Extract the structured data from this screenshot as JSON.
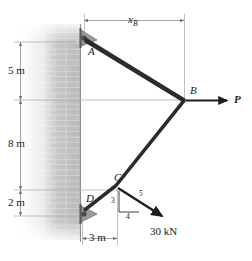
{
  "figure": {
    "type": "statics-free-body-diagram"
  },
  "dimensions": {
    "vertical": [
      {
        "id": "dim-5m",
        "label": "5 m",
        "from": "A",
        "to": "B-level"
      },
      {
        "id": "dim-8m",
        "label": "8 m",
        "from": "B-level",
        "to": "C-level"
      },
      {
        "id": "dim-2m",
        "label": "2 m",
        "from": "C-level",
        "to": "D"
      }
    ],
    "horizontal": [
      {
        "id": "dim-xb",
        "label": "x",
        "subscript": "B",
        "from": "wall",
        "to": "B"
      },
      {
        "id": "dim-3m",
        "label": "3 m",
        "from": "wall",
        "to": "C"
      }
    ]
  },
  "joints": [
    {
      "id": "A",
      "label": "A",
      "support": "pin"
    },
    {
      "id": "B",
      "label": "B",
      "support": "free"
    },
    {
      "id": "C",
      "label": "C",
      "support": "free"
    },
    {
      "id": "D",
      "label": "D",
      "support": "pin"
    }
  ],
  "forces": [
    {
      "id": "force-P",
      "label": "P",
      "applied_at": "B",
      "direction": "horizontal-right"
    },
    {
      "id": "force-30kN",
      "label": "30 kN",
      "applied_at": "C",
      "direction": "down-right",
      "slope": {
        "vertical": "3",
        "horizontal": "4",
        "hypotenuse": "5"
      }
    }
  ],
  "slope_triangle": {
    "vertical_leg": "3",
    "horizontal_leg": "4",
    "hypotenuse": "5"
  },
  "colors": {
    "member": "#2b2b2b",
    "dimension_line": "#8a8a8a",
    "wall_brick": "#b4b4b4",
    "text": "#1a1a1a",
    "support": "#6e6e6e"
  }
}
